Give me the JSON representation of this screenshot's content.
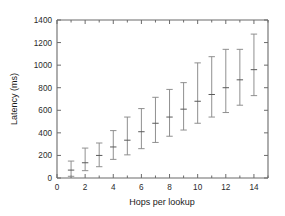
{
  "chart_data": {
    "type": "scatter",
    "title": "",
    "xlabel": "Hops per lookup",
    "ylabel": "Latency (ms)",
    "xlim": [
      0,
      15
    ],
    "ylim": [
      0,
      1400
    ],
    "grid": false,
    "legend": "none",
    "xticks": [
      0,
      2,
      4,
      6,
      8,
      10,
      12,
      14
    ],
    "xtick_labels": [
      "0",
      "2",
      "4",
      "6",
      "8",
      "10",
      "12",
      "14"
    ],
    "xminor_ticks": [
      1,
      3,
      5,
      7,
      9,
      11,
      13,
      15
    ],
    "yticks": [
      0,
      200,
      400,
      600,
      800,
      1000,
      1200,
      1400
    ],
    "ytick_labels": [
      "0",
      "200",
      "400",
      "600",
      "800",
      "1000",
      "1200",
      "1400"
    ],
    "error_style": "capped-vertical",
    "x": [
      1,
      2,
      3,
      4,
      5,
      6,
      7,
      8,
      9,
      10,
      11,
      12,
      13,
      14
    ],
    "values": [
      70,
      135,
      200,
      275,
      335,
      410,
      485,
      540,
      610,
      680,
      740,
      800,
      870,
      960
    ],
    "err_low": [
      15,
      65,
      100,
      165,
      205,
      260,
      315,
      370,
      425,
      485,
      540,
      580,
      645,
      730
    ],
    "err_high": [
      150,
      265,
      310,
      420,
      540,
      615,
      715,
      785,
      845,
      1020,
      1075,
      1140,
      1140,
      1275
    ],
    "series": [
      {
        "name": "lookup latency",
        "points": [
          {
            "x": 1,
            "y": 70,
            "low": 15,
            "high": 150
          },
          {
            "x": 2,
            "y": 135,
            "low": 65,
            "high": 265
          },
          {
            "x": 3,
            "y": 200,
            "low": 100,
            "high": 310
          },
          {
            "x": 4,
            "y": 275,
            "low": 165,
            "high": 420
          },
          {
            "x": 5,
            "y": 335,
            "low": 205,
            "high": 540
          },
          {
            "x": 6,
            "y": 410,
            "low": 260,
            "high": 615
          },
          {
            "x": 7,
            "y": 485,
            "low": 315,
            "high": 715
          },
          {
            "x": 8,
            "y": 540,
            "low": 370,
            "high": 785
          },
          {
            "x": 9,
            "y": 610,
            "low": 425,
            "high": 845
          },
          {
            "x": 10,
            "y": 680,
            "low": 485,
            "high": 1020
          },
          {
            "x": 11,
            "y": 740,
            "low": 540,
            "high": 1075
          },
          {
            "x": 12,
            "y": 800,
            "low": 580,
            "high": 1140
          },
          {
            "x": 13,
            "y": 870,
            "low": 645,
            "high": 1140
          },
          {
            "x": 14,
            "y": 960,
            "low": 730,
            "high": 1275
          }
        ]
      }
    ],
    "colors": {
      "axis": "#6b6b6b",
      "errorbar": "#8a8a8a",
      "marker": "#5a5a5a",
      "text": "#1a1a1a",
      "background": "#ffffff"
    }
  }
}
